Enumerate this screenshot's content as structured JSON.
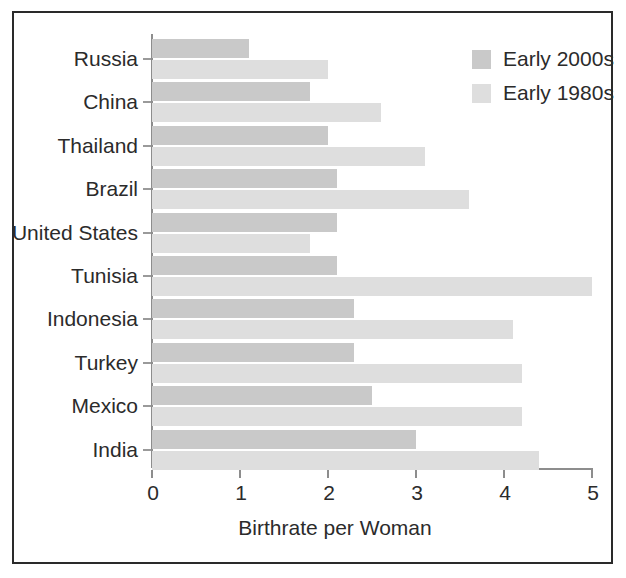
{
  "chart_data": {
    "type": "bar",
    "orientation": "horizontal",
    "title": "",
    "xlabel": "Birthrate per Woman",
    "ylabel": "",
    "xlim": [
      0,
      5
    ],
    "xticks": [
      0,
      1,
      2,
      3,
      4,
      5
    ],
    "xtick_labels": [
      "0",
      "1",
      "2",
      "3",
      "4",
      "5"
    ],
    "grid": false,
    "legend_position": "top-right",
    "categories": [
      "Russia",
      "China",
      "Thailand",
      "Brazil",
      "United States",
      "Tunisia",
      "Indonesia",
      "Turkey",
      "Mexico",
      "India"
    ],
    "series": [
      {
        "name": "Early 2000s",
        "color": "#c9c9c9",
        "values": [
          1.1,
          1.8,
          2.0,
          2.1,
          2.1,
          2.1,
          2.3,
          2.3,
          2.5,
          3.0
        ]
      },
      {
        "name": "Early 1980s",
        "color": "#dedede",
        "values": [
          2.0,
          2.6,
          3.1,
          3.6,
          1.8,
          5.0,
          4.1,
          4.2,
          4.2,
          4.4
        ]
      }
    ]
  },
  "legend": {
    "entries": [
      {
        "label": "Early 2000s",
        "swatch_color": "#c9c9c9"
      },
      {
        "label": "Early 1980s",
        "swatch_color": "#dedede"
      }
    ]
  },
  "axis": {
    "x_title": "Birthrate per Woman",
    "tick_labels": [
      "0",
      "1",
      "2",
      "3",
      "4",
      "5"
    ]
  },
  "colors": {
    "frame": "#2a2a2a",
    "axis": "#8d8d8d",
    "text": "#2b2b2b",
    "series_2000s": "#c9c9c9",
    "series_1980s": "#dedede",
    "background": "#ffffff"
  }
}
